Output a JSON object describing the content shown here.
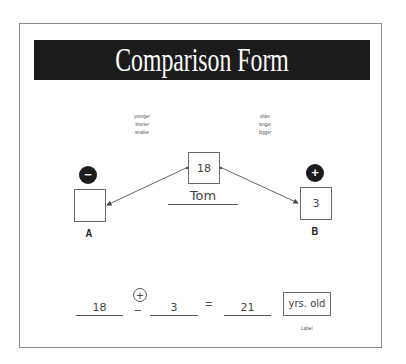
{
  "form": {
    "title": "Comparison Form",
    "left_hints": [
      "younger",
      "shorter",
      "smaller"
    ],
    "right_hints": [
      "older",
      "longer",
      "bigger"
    ],
    "center": {
      "value": "18",
      "name": "Tom"
    },
    "box_a": {
      "sign": "−",
      "sign_name": "minus",
      "value": "",
      "label": "A"
    },
    "box_b": {
      "sign": "+",
      "sign_name": "plus",
      "value": "3",
      "label": "B"
    },
    "equation": {
      "operand1": "18",
      "operator_options": [
        "+",
        "−"
      ],
      "operator_selected": "+",
      "operand2": "3",
      "equals": "=",
      "result": "21",
      "unit": "yrs. old",
      "unit_caption": "Label"
    }
  }
}
